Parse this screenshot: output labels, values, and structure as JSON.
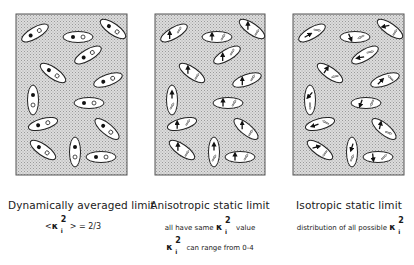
{
  "panels": [
    {
      "title": "Dynamically averaged limit",
      "line1_prefix": "<",
      "line1_symbol": "κ",
      "line1_sup": "2",
      "line1_sub": "i",
      "line1_suffix": ">  =  2/3",
      "dipole_style": "dots"
    },
    {
      "title": "Anisotropic static limit",
      "line1_prefix": "all have same",
      "line1_symbol": "κ",
      "line1_sup": "2",
      "line1_sub": "i",
      "line1_suffix": "value",
      "line2_symbol": "κ",
      "line2_sup": "2",
      "line2_sub": "i",
      "line2_suffix": "can range from 0-4",
      "dipole_style": "parallel-arrows"
    },
    {
      "title": "Isotropic static limit",
      "line1_prefix": "distribution of all possible",
      "line1_symbol": "κ",
      "line1_sup": "2",
      "line1_sub": "i",
      "dipole_style": "random-arrows"
    }
  ],
  "colors": {
    "panel_fill": "#d4d4d4",
    "panel_border": "#555555",
    "ellipse_fill": "#ffffff",
    "ellipse_stroke": "#222222",
    "donor": "#111111"
  }
}
